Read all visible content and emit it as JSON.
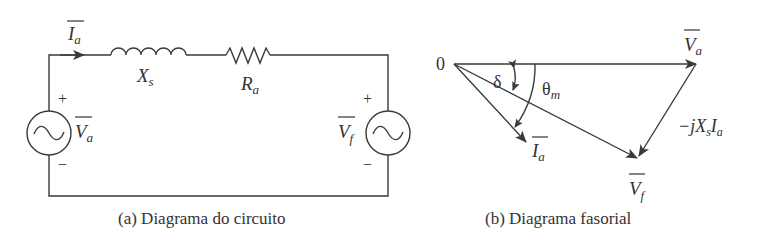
{
  "circuit": {
    "caption": "(a) Diagrama do circuito",
    "current_label": "I",
    "current_sub": "a",
    "inductor_label": "X",
    "inductor_sub": "s",
    "resistor_label": "R",
    "resistor_sub": "a",
    "left_source": {
      "label": "V",
      "sub": "a",
      "plus": "+",
      "minus": "−",
      "icon": "ac-source-icon"
    },
    "right_source": {
      "label": "V",
      "sub": "f",
      "plus": "+",
      "minus": "−",
      "icon": "ac-source-icon"
    }
  },
  "phasor": {
    "caption": "(b) Diagrama fasorial",
    "origin_label": "0",
    "va_label": "V",
    "va_sub": "a",
    "ia_label": "I",
    "ia_sub": "a",
    "vf_label": "V",
    "vf_sub": "f",
    "delta_label": "δ",
    "theta_label": "θ",
    "theta_sub": "m",
    "drop_label_prefix": "−jX",
    "drop_label_sub1": "s",
    "drop_label_mid": "I",
    "drop_label_sub2": "a"
  },
  "colors": {
    "ink": "#333333"
  }
}
